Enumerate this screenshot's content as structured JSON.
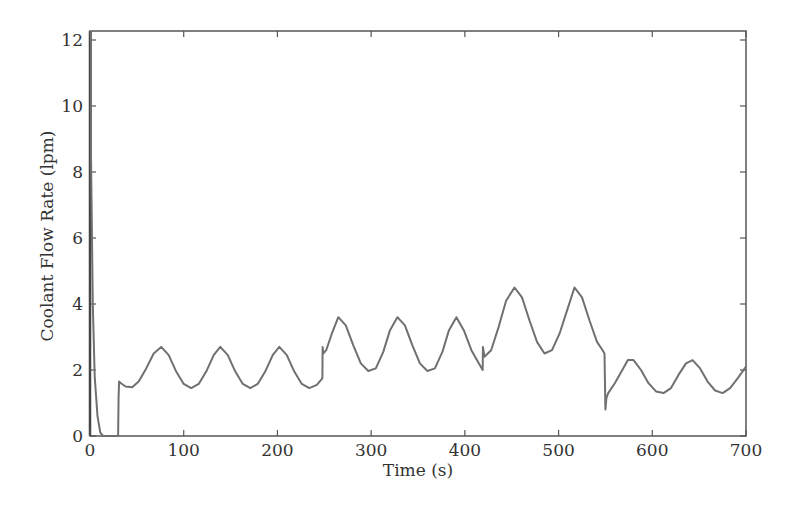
{
  "chart_data": {
    "type": "line",
    "title": "",
    "xlabel": "Time (s)",
    "ylabel": "Coolant Flow Rate (lpm)",
    "xlim": [
      0,
      700
    ],
    "ylim": [
      0,
      12.2
    ],
    "xticks": [
      0,
      100,
      200,
      300,
      400,
      500,
      600,
      700
    ],
    "yticks": [
      0,
      2,
      4,
      6,
      8,
      10,
      12
    ],
    "grid": false,
    "legend": null,
    "line_color": "#707070",
    "series": [
      {
        "name": "Coolant Flow Rate",
        "x": [
          0,
          1,
          3,
          5,
          8,
          11,
          14,
          30,
          30.5,
          31,
          33,
          38,
          45,
          52,
          60,
          68,
          76,
          84,
          92,
          100,
          108,
          116,
          124,
          132,
          139,
          147,
          155,
          163,
          171,
          179,
          187,
          195,
          202,
          210,
          218,
          226,
          234,
          242,
          248,
          248.2,
          249,
          252,
          258,
          265,
          273,
          281,
          289,
          297,
          305,
          313,
          320,
          328,
          336,
          344,
          352,
          360,
          368,
          376,
          383,
          391,
          399,
          407,
          415,
          419,
          419.2,
          421,
          428,
          436,
          444,
          453,
          461,
          469,
          477,
          485,
          493,
          501,
          509,
          517,
          525,
          533,
          541,
          547,
          549,
          550,
          551,
          553,
          560,
          568,
          574,
          580,
          588,
          596,
          604,
          612,
          620,
          628,
          636,
          643,
          651,
          659,
          667,
          675,
          683,
          691,
          700
        ],
        "y": [
          12.3,
          8.5,
          4.0,
          1.8,
          0.6,
          0.1,
          0.0,
          0.0,
          1.2,
          1.65,
          1.6,
          1.5,
          1.48,
          1.65,
          2.05,
          2.5,
          2.7,
          2.45,
          1.95,
          1.58,
          1.45,
          1.58,
          1.95,
          2.45,
          2.7,
          2.45,
          1.95,
          1.58,
          1.45,
          1.58,
          1.95,
          2.45,
          2.7,
          2.45,
          1.95,
          1.58,
          1.45,
          1.55,
          1.75,
          2.7,
          2.5,
          2.6,
          3.1,
          3.6,
          3.35,
          2.75,
          2.2,
          1.97,
          2.05,
          2.55,
          3.2,
          3.6,
          3.35,
          2.75,
          2.2,
          1.97,
          2.05,
          2.55,
          3.2,
          3.6,
          3.2,
          2.6,
          2.2,
          2.0,
          2.7,
          2.4,
          2.6,
          3.3,
          4.1,
          4.5,
          4.2,
          3.5,
          2.85,
          2.5,
          2.6,
          3.1,
          3.8,
          4.5,
          4.2,
          3.5,
          2.85,
          2.6,
          2.5,
          0.8,
          1.15,
          1.3,
          1.6,
          2.0,
          2.3,
          2.3,
          2.0,
          1.6,
          1.35,
          1.3,
          1.45,
          1.85,
          2.2,
          2.3,
          2.05,
          1.65,
          1.38,
          1.3,
          1.45,
          1.75,
          2.1
        ]
      }
    ]
  },
  "plot": {
    "xlabel": "Time (s)",
    "ylabel": "Coolant Flow Rate (lpm)"
  }
}
